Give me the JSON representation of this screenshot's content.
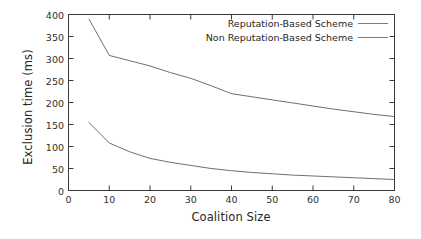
{
  "chart_data": {
    "type": "line",
    "title": "",
    "xlabel": "Coalition Size",
    "ylabel": "Exclusion time (ms)",
    "xlim": [
      0,
      80
    ],
    "ylim": [
      0,
      400
    ],
    "xticks": [
      0,
      10,
      20,
      30,
      40,
      50,
      60,
      70,
      80
    ],
    "yticks": [
      0,
      50,
      100,
      150,
      200,
      250,
      300,
      350,
      400
    ],
    "grid": false,
    "legend_position": "top-right-inside",
    "line_color": "#6f6f6f",
    "axis_color": "#3a3a3a",
    "background": "#ffffff",
    "series": [
      {
        "name": "Reputation-Based  Scheme",
        "x": [
          5,
          10,
          15,
          20,
          25,
          30,
          35,
          40,
          45,
          50,
          55,
          60,
          65,
          70,
          75,
          80
        ],
        "values": [
          155,
          108,
          88,
          73,
          64,
          57,
          50,
          45,
          41,
          38,
          35,
          33,
          31,
          29,
          27,
          25
        ]
      },
      {
        "name": "Non Reputation-Based Scheme",
        "x": [
          5,
          10,
          15,
          20,
          25,
          30,
          35,
          40,
          45,
          50,
          55,
          60,
          65,
          70,
          75,
          80
        ],
        "values": [
          390,
          307,
          295,
          283,
          268,
          255,
          238,
          220,
          213,
          206,
          199,
          192,
          185,
          179,
          173,
          168
        ]
      }
    ]
  },
  "legend": {
    "entries": [
      {
        "label": "Reputation-Based  Scheme"
      },
      {
        "label": "Non Reputation-Based Scheme"
      }
    ]
  },
  "axes": {
    "x_title": "Coalition Size",
    "y_title": "Exclusion time (ms)",
    "x_tick_labels": [
      "0",
      "10",
      "20",
      "30",
      "40",
      "50",
      "60",
      "70",
      "80"
    ],
    "y_tick_labels": [
      "0",
      "50",
      "100",
      "150",
      "200",
      "250",
      "300",
      "350",
      "400"
    ]
  }
}
